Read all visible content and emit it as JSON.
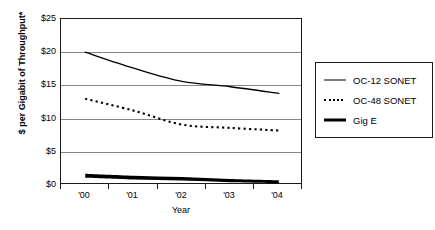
{
  "chart_data": {
    "type": "line",
    "title": "",
    "xlabel": "Year",
    "ylabel": "$ per Gigabit of Throughput*",
    "categories": [
      "'00",
      "'01",
      "'02",
      "'03",
      "'04"
    ],
    "x": [
      2000,
      2001,
      2002,
      2003,
      2004
    ],
    "ylim": [
      0,
      25
    ],
    "yticks": [
      "$0",
      "$5",
      "$10",
      "$15",
      "$20",
      "$25"
    ],
    "ytick_values": [
      0,
      5,
      10,
      15,
      20,
      25
    ],
    "grid": "horizontal",
    "legend_position": "right-outside",
    "series": [
      {
        "name": "OC-12 SONET",
        "style": "solid",
        "values": [
          20.0,
          17.6,
          15.6,
          14.8,
          13.8
        ]
      },
      {
        "name": "OC-48 SONET",
        "style": "dotted",
        "values": [
          13.0,
          11.2,
          9.1,
          8.6,
          8.2
        ]
      },
      {
        "name": "Gig E",
        "style": "thick-solid",
        "values": [
          1.4,
          1.1,
          0.9,
          0.6,
          0.4
        ]
      }
    ]
  },
  "axes": {
    "y_tick_labels": [
      "$25",
      "$20",
      "$15",
      "$10",
      "$5",
      "$0"
    ],
    "x_tick_labels": [
      "'00",
      "'01",
      "'02",
      "'03",
      "'04"
    ],
    "x_axis_title": "Year",
    "y_axis_title": "$ per Gigabit of Throughput*"
  },
  "legend": {
    "items": [
      {
        "label": "OC-12 SONET",
        "icon": "solid-line-icon"
      },
      {
        "label": "OC-48 SONET",
        "icon": "dotted-line-icon"
      },
      {
        "label": "Gig E",
        "icon": "thick-line-icon"
      }
    ]
  },
  "colors": {
    "line": "#000000",
    "gridline": "#868686",
    "frame": "#1a1a1a",
    "background": "#ffffff"
  }
}
